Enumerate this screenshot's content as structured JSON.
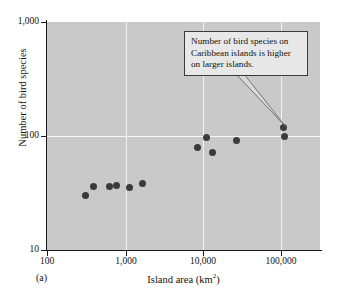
{
  "panel": {
    "label": "(a)"
  },
  "annotation": {
    "text": "Number of bird species on Caribbean islands is higher on larger islands.",
    "lines": [
      "Number of bird species on",
      "Caribbean islands is higher",
      "on larger islands."
    ],
    "target_point_index": 10
  },
  "colors": {
    "plot_background": "#c9c9c9",
    "gridline": "#f2f2f2",
    "axis": "#1a1a1a",
    "point": "#3b3b3b",
    "annotation_background": "#e8e8e8",
    "annotation_border": "#3a3a3a",
    "page_background": "#ffffff"
  },
  "chart_data": {
    "type": "scatter",
    "title": "",
    "xlabel": "Island area (km2)",
    "xlabel_base": "Island area (km",
    "xlabel_sup": "2",
    "xlabel_tail": ")",
    "ylabel": "Number of bird species",
    "xscale": "log",
    "yscale": "log",
    "xlim": [
      100,
      400000
    ],
    "ylim": [
      10,
      1000
    ],
    "xticks": [
      100,
      1000,
      10000,
      100000
    ],
    "xticklabels": [
      "100",
      "1,000",
      "10,000",
      "100,000"
    ],
    "yticks": [
      10,
      100,
      1000
    ],
    "yticklabels": [
      "10",
      "100",
      "1,000"
    ],
    "grid": true,
    "legend": "none",
    "points": [
      {
        "x": 310,
        "y": 30
      },
      {
        "x": 400,
        "y": 36
      },
      {
        "x": 640,
        "y": 36
      },
      {
        "x": 790,
        "y": 37
      },
      {
        "x": 1170,
        "y": 35
      },
      {
        "x": 1700,
        "y": 38
      },
      {
        "x": 8800,
        "y": 80
      },
      {
        "x": 11500,
        "y": 98
      },
      {
        "x": 13500,
        "y": 72
      },
      {
        "x": 28000,
        "y": 91
      },
      {
        "x": 112000,
        "y": 118
      },
      {
        "x": 115000,
        "y": 100
      }
    ]
  }
}
